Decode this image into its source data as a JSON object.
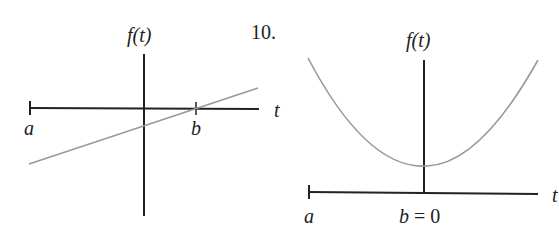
{
  "figures": [
    {
      "id": "left",
      "y_axis_label": "f(t)",
      "x_axis_label": "t",
      "point_a_label": "a",
      "point_b_label": "b",
      "curve": "straight line with positive slope, crossing t-axis at b"
    },
    {
      "id": "right",
      "problem_number": "10.",
      "y_axis_label": "f(t)",
      "x_axis_label": "t",
      "point_a_label": "a",
      "point_b_label": "b = 0",
      "curve": "upward-opening parabola with minimum above the t-axis at t = 0"
    }
  ],
  "colors": {
    "axis": "#222222",
    "curve": "#999999",
    "background": "#ffffff"
  }
}
